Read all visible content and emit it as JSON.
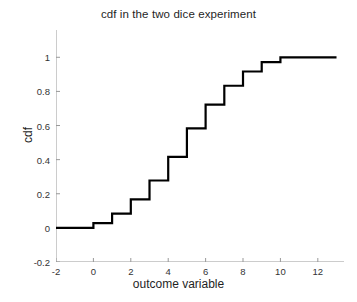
{
  "chart_data": {
    "type": "line",
    "subtype": "step-post",
    "title": "cdf in the two dice experiment",
    "xlabel": "outcome variable",
    "ylabel": "cdf",
    "xlim": [
      -2,
      13.4
    ],
    "ylim": [
      -0.2,
      1.16
    ],
    "xticks": [
      -2,
      0,
      2,
      4,
      6,
      8,
      10,
      12
    ],
    "xtick_labels": [
      "-2",
      "0",
      "2",
      "4",
      "6",
      "8",
      "10",
      "12"
    ],
    "yticks": [
      -0.2,
      0,
      0.2,
      0.4,
      0.6,
      0.8,
      1
    ],
    "ytick_labels": [
      "-0.2",
      "0",
      "0.2",
      "0.4",
      "0.6",
      "0.8",
      "1"
    ],
    "grid": false,
    "legend": false,
    "line_color": "#000000",
    "line_width": 2.2,
    "axis_color": "#999999",
    "x": [
      -2,
      0,
      1,
      2,
      3,
      4,
      5,
      6,
      7,
      8,
      9,
      10,
      13
    ],
    "y": [
      0,
      0.0278,
      0.0833,
      0.1667,
      0.2778,
      0.4167,
      0.5833,
      0.7222,
      0.8333,
      0.9167,
      0.9722,
      1.0,
      1.0
    ],
    "step_points": [
      {
        "x": -2,
        "y": 0
      },
      {
        "x": 0,
        "y": 0.0278
      },
      {
        "x": 1,
        "y": 0.0833
      },
      {
        "x": 2,
        "y": 0.1667
      },
      {
        "x": 3,
        "y": 0.2778
      },
      {
        "x": 4,
        "y": 0.4167
      },
      {
        "x": 5,
        "y": 0.5833
      },
      {
        "x": 6,
        "y": 0.7222
      },
      {
        "x": 7,
        "y": 0.8333
      },
      {
        "x": 8,
        "y": 0.9167
      },
      {
        "x": 9,
        "y": 0.9722
      },
      {
        "x": 10,
        "y": 1.0
      },
      {
        "x": 13,
        "y": 1.0
      }
    ]
  }
}
